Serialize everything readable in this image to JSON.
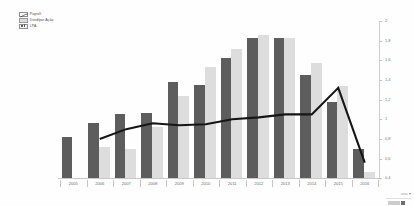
{
  "chart": {
    "title": "",
    "subtitle": ""
  },
  "legend": {
    "position": "top-left",
    "items": [
      {
        "label": "Payroll",
        "icon": "line-series-icon",
        "type": "line",
        "color": "#1a1a1a"
      },
      {
        "label": "Divid/por Ação",
        "icon": "light-bar-series-icon",
        "type": "bar",
        "color": "#dddddd"
      },
      {
        "label": "LPA",
        "icon": "dark-bar-series-icon",
        "type": "bar",
        "color": "#5d5d5d"
      }
    ]
  },
  "axes": {
    "y_right": {
      "ticks": [
        "2",
        "1,8",
        "1,6",
        "1,4",
        "1,2",
        "1",
        "0,8",
        "0,6",
        "0,4"
      ],
      "values": [
        2,
        1.8,
        1.6,
        1.4,
        1.2,
        1,
        0.8,
        0.6,
        0.4
      ],
      "min": 0.4,
      "max": 2.0,
      "step": 0.2,
      "position": "right",
      "label": ""
    },
    "x": {
      "ticks": [
        "2005",
        "2006",
        "2007",
        "2008",
        "2009",
        "2010",
        "2011",
        "2012",
        "2013",
        "2014",
        "2015",
        "2016"
      ],
      "label": ""
    }
  },
  "footer": {
    "widget_label": "area",
    "caret_icon": "chevron-down-icon"
  },
  "chart_data": {
    "type": "bar",
    "title": "",
    "xlabel": "",
    "ylabel": "",
    "ylim": [
      0.4,
      2.0
    ],
    "grid": false,
    "legend_position": "top-left",
    "categories": [
      "2005",
      "2006",
      "2007",
      "2008",
      "2009",
      "2010",
      "2011",
      "2012",
      "2013",
      "2014",
      "2015",
      "2016"
    ],
    "series": [
      {
        "name": "LPA",
        "type": "bar",
        "color": "#5d5d5d",
        "values": [
          0.82,
          0.96,
          1.05,
          1.06,
          1.38,
          1.35,
          1.62,
          1.83,
          1.83,
          1.45,
          1.18,
          0.7
        ]
      },
      {
        "name": "Divid/por Ação",
        "type": "bar",
        "color": "#dddddd",
        "values": [
          0.4,
          0.72,
          0.7,
          0.92,
          1.24,
          1.53,
          1.72,
          1.86,
          1.83,
          1.57,
          1.34,
          0.46
        ]
      },
      {
        "name": "Payroll",
        "type": "line",
        "color": "#1a1a1a",
        "values": [
          null,
          0.8,
          0.9,
          0.96,
          0.94,
          0.95,
          1.0,
          1.02,
          1.05,
          1.05,
          1.32,
          0.56
        ]
      }
    ]
  }
}
